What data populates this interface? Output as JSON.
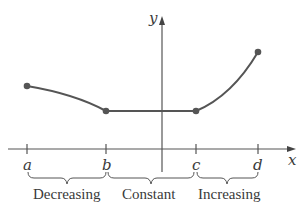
{
  "diagram": {
    "axes": {
      "x_label": "x",
      "y_label": "y"
    },
    "points": [
      {
        "label": "a",
        "px": 27,
        "py": 86
      },
      {
        "label": "b",
        "px": 106,
        "py": 111
      },
      {
        "label": "c",
        "px": 196,
        "py": 111
      },
      {
        "label": "d",
        "px": 258,
        "py": 52
      }
    ],
    "intervals": [
      {
        "label": "Decreasing",
        "from": "a",
        "to": "b"
      },
      {
        "label": "Constant",
        "from": "b",
        "to": "c"
      },
      {
        "label": "Increasing",
        "from": "c",
        "to": "d"
      }
    ],
    "colors": {
      "curve": "#555555",
      "axis": "#444444",
      "text": "#3a3a3a"
    }
  }
}
